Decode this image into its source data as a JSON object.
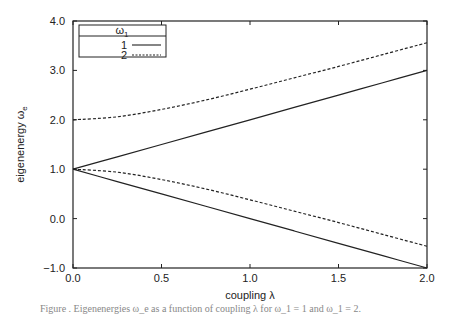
{
  "chart_data": {
    "type": "line",
    "title": "",
    "xlabel": "coupling λ",
    "ylabel": "eigenenergy ω",
    "ylabel_subscript": "e",
    "xlim": [
      0.0,
      2.0
    ],
    "ylim": [
      -1.0,
      4.0
    ],
    "xticks": [
      "0.0",
      "0.5",
      "1.0",
      "1.5",
      "2.0"
    ],
    "xtick_values": [
      0.0,
      0.5,
      1.0,
      1.5,
      2.0
    ],
    "yticks": [
      "-1.0",
      "0.0",
      "1.0",
      "2.0",
      "3.0",
      "4.0"
    ],
    "ytick_values": [
      -1.0,
      0.0,
      1.0,
      2.0,
      3.0,
      4.0
    ],
    "grid": false,
    "legend": {
      "position": "upper left",
      "title": "ω",
      "title_subscript": "1",
      "entries": [
        {
          "label": "1",
          "style": "solid"
        },
        {
          "label": "2",
          "style": "dashed"
        }
      ]
    },
    "x": [
      0.0,
      0.25,
      0.5,
      0.75,
      1.0,
      1.25,
      1.5,
      1.75,
      2.0
    ],
    "series": [
      {
        "name": "1",
        "branch": "upper",
        "style": "solid",
        "values": [
          1.0,
          1.25,
          1.5,
          1.75,
          2.0,
          2.25,
          2.5,
          2.75,
          3.0
        ]
      },
      {
        "name": "1",
        "branch": "lower",
        "style": "solid",
        "values": [
          1.0,
          0.75,
          0.5,
          0.25,
          0.0,
          -0.25,
          -0.5,
          -0.75,
          -1.0
        ]
      },
      {
        "name": "2",
        "branch": "upper",
        "style": "dashed",
        "values": [
          2.0,
          2.06,
          2.21,
          2.4,
          2.62,
          2.85,
          3.08,
          3.32,
          3.56
        ]
      },
      {
        "name": "2",
        "branch": "lower",
        "style": "dashed",
        "values": [
          1.0,
          0.94,
          0.79,
          0.6,
          0.38,
          0.15,
          -0.08,
          -0.32,
          -0.56
        ]
      }
    ]
  },
  "caption": "Figure . Eigenenergies ω_e as a function of coupling λ for ω_1 = 1 and ω_1 = 2."
}
